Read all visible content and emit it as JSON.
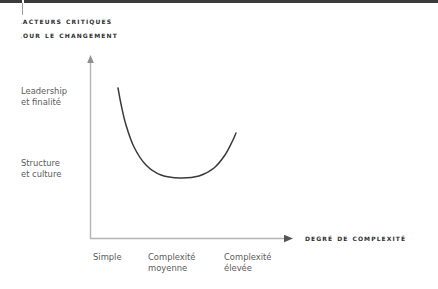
{
  "figure": {
    "title_lines": [
      "Facteurs critiques",
      "pour le changement"
    ],
    "colors": {
      "rule": "#3b3b3b",
      "axis": "#b4b4b4",
      "curve": "#3a3a3a",
      "title_text": "#2f2f2f",
      "label_text": "#5a5a5a",
      "background": "#ffffff"
    }
  },
  "y_axis": {
    "labels": [
      {
        "lines": [
          "Leadership",
          "et finalité"
        ]
      },
      {
        "lines": [
          "Structure",
          "et culture"
        ]
      }
    ]
  },
  "x_axis": {
    "title": "Degré de complexité",
    "ticks": [
      {
        "lines": [
          "Simple"
        ]
      },
      {
        "lines": [
          "Complexité",
          "moyenne"
        ]
      },
      {
        "lines": [
          "Complexité",
          "élevée"
        ]
      }
    ]
  },
  "chart_data": {
    "type": "line",
    "title": "Facteurs critiques pour le changement",
    "xlabel": "Degré de complexité",
    "ylabel": "",
    "grid": false,
    "legend": null,
    "annotations": [],
    "x_tick_labels": [
      "Simple",
      "Complexité moyenne",
      "Complexité élevée"
    ],
    "y_tick_labels": [
      "Structure et culture",
      "Leadership et finalité"
    ],
    "xlim": [
      0,
      3
    ],
    "ylim": [
      0,
      3
    ],
    "series": [
      {
        "name": "Facteurs critiques",
        "comment": "U-shaped curve in pixel coordinates of the 438x289 canvas",
        "points_px": [
          [
            118,
            88
          ],
          [
            121,
            104
          ],
          [
            126,
            125
          ],
          [
            134,
            147
          ],
          [
            146,
            165
          ],
          [
            161,
            175
          ],
          [
            180,
            178
          ],
          [
            199,
            176
          ],
          [
            214,
            168
          ],
          [
            225,
            155
          ],
          [
            232,
            142
          ],
          [
            236,
            133
          ]
        ]
      }
    ]
  },
  "geometry": {
    "y_axis_x": 90,
    "y_axis_top": 56,
    "y_axis_bottom": 238,
    "x_axis_y": 238,
    "x_axis_left": 90,
    "x_axis_right": 292
  }
}
